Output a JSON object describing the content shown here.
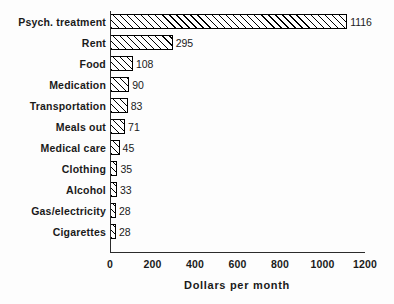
{
  "chart_data": {
    "type": "bar",
    "orientation": "horizontal",
    "title": "",
    "xlabel": "Dollars per month",
    "ylabel": "",
    "xlim": [
      0,
      1200
    ],
    "xticks": [
      0,
      200,
      400,
      600,
      800,
      1000,
      1200
    ],
    "xtick_labels": [
      "0",
      "200",
      "400",
      "600",
      "800",
      "1000",
      "1200"
    ],
    "grid": false,
    "legend": null,
    "categories": [
      "Psych. treatment",
      "Rent",
      "Food",
      "Medication",
      "Transportation",
      "Meals out",
      "Medical care",
      "Clothing",
      "Alcohol",
      "Gas/electricity",
      "Cigarettes"
    ],
    "values": [
      1116,
      295,
      108,
      90,
      83,
      71,
      45,
      35,
      33,
      28,
      28
    ],
    "value_labels": [
      "1116",
      "295",
      "108",
      "90",
      "83",
      "71",
      "45",
      "35",
      "33",
      "28",
      "28"
    ],
    "bar_style": {
      "fill": "#ffffff",
      "edge": "#000000",
      "hatch": "diagonal-forward-slash"
    }
  },
  "axis": {
    "line_color": "#2b2b2b"
  }
}
